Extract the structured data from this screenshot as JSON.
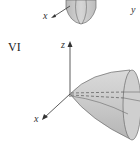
{
  "figure": {
    "panel_top": {
      "axis_labels": {
        "x": "x",
        "y": "y"
      }
    },
    "panel_bottom": {
      "roman_label": "VI",
      "axis_labels": {
        "x": "x",
        "z": "z"
      }
    },
    "colors": {
      "surface_fill": "#c8c8c8",
      "surface_edge": "#6a6a6a",
      "axis": "#333333"
    }
  }
}
